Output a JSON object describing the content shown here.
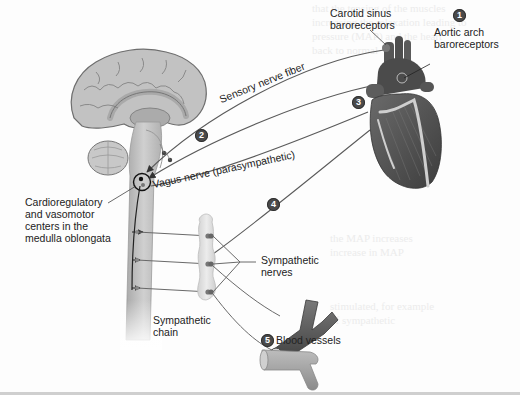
{
  "diagram": {
    "labels": {
      "carotid_sinus": [
        "Carotid sinus",
        "baroreceptors"
      ],
      "aortic_arch": [
        "Aortic arch",
        "baroreceptors"
      ],
      "sensory_nerve": "Sensory nerve fiber",
      "vagus_nerve": "Vagus nerve (parasympathetic)",
      "cardioregulatory": [
        "Cardioregulatory",
        "and vasomotor",
        "centers in the",
        "medulla oblongata"
      ],
      "sympathetic_nerves": [
        "Sympathetic",
        "nerves"
      ],
      "sympathetic_chain": [
        "Sympathetic",
        "chain"
      ],
      "blood_vessels": "Blood vessels"
    },
    "steps": [
      {
        "number": "1",
        "target": "Aortic arch baroreceptors"
      },
      {
        "number": "2",
        "target": "Sensory nerve fiber"
      },
      {
        "number": "3",
        "target": "Vagus nerve to heart"
      },
      {
        "number": "4",
        "target": "Sympathetic nerve to heart"
      },
      {
        "number": "5",
        "target": "Blood vessels"
      }
    ],
    "colors": {
      "brain": "#bdbdbd",
      "brain_outline": "#6f6f6f",
      "spinal_cord": "#c9c9c9",
      "heart": "#5b5b5b",
      "heart_vessels": "#d9d9d9",
      "nerve_line": "#555555",
      "badge": "#4a4a4a",
      "sympathetic_chain": "#e2e2e2",
      "vessel_dark": "#5a5a5a",
      "vessel_light": "#9a9a9a"
    }
  }
}
